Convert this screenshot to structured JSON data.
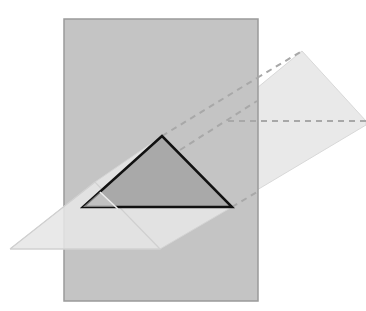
{
  "diagram": {
    "title": "",
    "colors": {
      "background": "#ffffff",
      "plane_fill": "#c4c4c4",
      "plane_stroke": "#9a9a9a",
      "prism_fill": "#e6e6e6",
      "prism_stroke": "#d2d2d2",
      "cross_section_fill": "#a9a9a9",
      "cross_section_stroke": "#111111",
      "hidden_edge_stroke": "#a8a8a8",
      "visible_inner_edge": "#ededed"
    },
    "plane": {
      "x": 64,
      "y": 19,
      "width": 194,
      "height": 282
    },
    "prism": {
      "near_face": [
        [
          10,
          249
        ],
        [
          95,
          182
        ],
        [
          160,
          249
        ]
      ],
      "far_face": [
        [
          228,
          121
        ],
        [
          302,
          51
        ],
        [
          366,
          121
        ]
      ],
      "outline": [
        [
          10,
          249
        ],
        [
          95,
          182
        ],
        [
          302,
          51
        ],
        [
          366,
          121
        ],
        [
          366,
          125
        ],
        [
          160,
          249
        ]
      ]
    },
    "cross_section": {
      "points": [
        [
          162,
          136
        ],
        [
          83,
          207
        ],
        [
          232,
          207
        ]
      ]
    },
    "hidden_edges": [
      [
        [
          162,
          136
        ],
        [
          302,
          51
        ]
      ],
      [
        [
          180,
          150
        ],
        [
          257,
          100
        ]
      ],
      [
        [
          228,
          121
        ],
        [
          366,
          121
        ]
      ],
      [
        [
          232,
          207
        ],
        [
          257,
          193
        ]
      ]
    ]
  }
}
